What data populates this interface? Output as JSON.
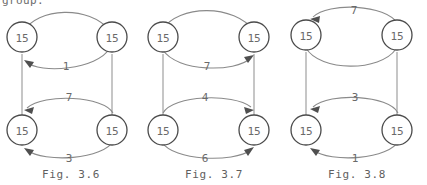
{
  "page": {
    "cut_off_text": "group.",
    "node_value": "15",
    "background_color": "#ffffff",
    "ink_color": "#6a6a6a"
  },
  "figures": [
    {
      "id": "fig-3-6",
      "caption": "Fig. 3.6",
      "nodes": [
        {
          "name": "top-left",
          "label": "15"
        },
        {
          "name": "top-right",
          "label": "15"
        },
        {
          "name": "bottom-left",
          "label": "15"
        },
        {
          "name": "bottom-right",
          "label": "15"
        }
      ],
      "edges": [
        {
          "name": "top-outer-arc",
          "label": "",
          "direction": "right",
          "style": "arc-above"
        },
        {
          "name": "top-inner-arc",
          "label": "1",
          "direction": "left",
          "style": "arc-below"
        },
        {
          "name": "left-vertical",
          "label": "",
          "direction": "down",
          "style": "straight"
        },
        {
          "name": "right-vertical",
          "label": "",
          "direction": "down",
          "style": "straight"
        },
        {
          "name": "bottom-upper-arc",
          "label": "7",
          "direction": "left",
          "style": "arc-above"
        },
        {
          "name": "bottom-lower-arc",
          "label": "3",
          "direction": "left",
          "style": "arc-below"
        }
      ]
    },
    {
      "id": "fig-3-7",
      "caption": "Fig. 3.7",
      "nodes": [
        {
          "name": "top-left",
          "label": "15"
        },
        {
          "name": "top-right",
          "label": "15"
        },
        {
          "name": "bottom-left",
          "label": "15"
        },
        {
          "name": "bottom-right",
          "label": "15"
        }
      ],
      "edges": [
        {
          "name": "top-outer-arc",
          "label": "",
          "direction": "right",
          "style": "arc-above"
        },
        {
          "name": "top-inner-arc",
          "label": "7",
          "direction": "right",
          "style": "arc-below"
        },
        {
          "name": "left-vertical",
          "label": "",
          "direction": "down",
          "style": "straight"
        },
        {
          "name": "right-vertical",
          "label": "",
          "direction": "down",
          "style": "straight"
        },
        {
          "name": "bottom-upper-arc",
          "label": "4",
          "direction": "right",
          "style": "arc-above"
        },
        {
          "name": "bottom-lower-arc",
          "label": "6",
          "direction": "right",
          "style": "arc-below"
        }
      ]
    },
    {
      "id": "fig-3-8",
      "caption": "Fig. 3.8",
      "nodes": [
        {
          "name": "top-left",
          "label": "15"
        },
        {
          "name": "top-right",
          "label": "15"
        },
        {
          "name": "bottom-left",
          "label": "15"
        },
        {
          "name": "bottom-right",
          "label": "15"
        }
      ],
      "edges": [
        {
          "name": "top-outer-arc",
          "label": "7",
          "direction": "left",
          "style": "arc-above"
        },
        {
          "name": "top-inner-arc",
          "label": "",
          "direction": "right",
          "style": "arc-below"
        },
        {
          "name": "left-vertical",
          "label": "",
          "direction": "down",
          "style": "straight"
        },
        {
          "name": "right-vertical",
          "label": "",
          "direction": "down",
          "style": "straight"
        },
        {
          "name": "bottom-upper-arc",
          "label": "3",
          "direction": "left",
          "style": "arc-above"
        },
        {
          "name": "bottom-lower-arc",
          "label": "1",
          "direction": "left",
          "style": "arc-below"
        }
      ]
    }
  ]
}
